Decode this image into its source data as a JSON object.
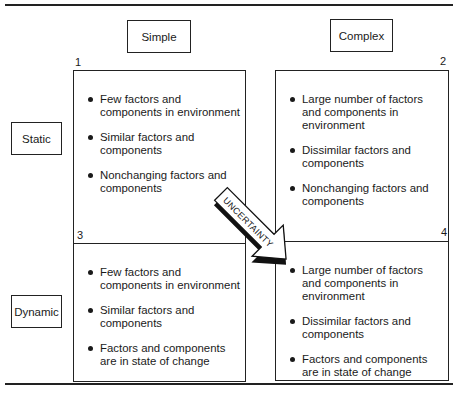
{
  "columns": [
    "Simple",
    "Complex"
  ],
  "rows": [
    "Static",
    "Dynamic"
  ],
  "arrow_label": "UNCERTAINTY",
  "cells": [
    {
      "number": "1",
      "items": [
        "Few factors and components in environment",
        "Similar factors and components",
        "Nonchanging factors and components"
      ]
    },
    {
      "number": "2",
      "items": [
        "Large number of factors and components in environment",
        "Dissimilar factors and components",
        "Nonchanging factors and components"
      ]
    },
    {
      "number": "3",
      "items": [
        "Few factors and components in environment",
        "Similar factors and components",
        "Factors and components are in state of change"
      ]
    },
    {
      "number": "4",
      "items": [
        "Large number of factors and components in environment",
        "Dissimilar factors and components",
        "Factors and components are in state of change"
      ]
    }
  ]
}
